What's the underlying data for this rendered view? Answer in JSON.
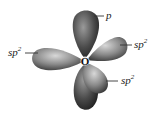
{
  "diagram": {
    "atom": {
      "symbol": "O"
    },
    "orbitals": [
      {
        "id": "p-top",
        "type": "p",
        "direction": "up"
      },
      {
        "id": "p-bottom",
        "type": "p",
        "direction": "down"
      },
      {
        "id": "sp2-left",
        "type": "sp2",
        "direction": "left"
      },
      {
        "id": "sp2-upper-right",
        "type": "sp2",
        "direction": "upper-right"
      },
      {
        "id": "sp2-lower-right",
        "type": "sp2",
        "direction": "lower-right"
      }
    ],
    "labels": {
      "p": {
        "base": "p",
        "sup": ""
      },
      "sp2_left": {
        "base": "sp",
        "sup": "2"
      },
      "sp2_upper_right": {
        "base": "sp",
        "sup": "2"
      },
      "sp2_lower_right": {
        "base": "sp",
        "sup": "2"
      }
    },
    "colors": {
      "lobe_dark": "#3a3a3a",
      "lobe_mid": "#7a7a7a",
      "lobe_light": "#bdbdbd",
      "background": "#ffffff"
    }
  }
}
